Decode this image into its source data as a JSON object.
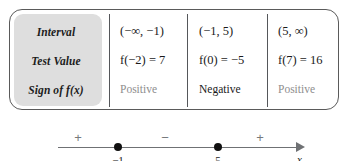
{
  "table": {
    "row_labels": [
      "Interval",
      "Test Value",
      "Sign of f(x)"
    ],
    "columns": [
      {
        "interval": "(−∞, −1)",
        "test_value": "f(−2) = 7",
        "sign": "Positive"
      },
      {
        "interval": "(−1, 5)",
        "test_value": "f(0) = −5",
        "sign": "Negative"
      },
      {
        "interval": "(5, ∞)",
        "test_value": "f(7) = 16",
        "sign": "Positive"
      }
    ],
    "label_panel_color": "#dedede",
    "border_color": "#5a5a5a",
    "muted_text_color": "#8e8e8e"
  },
  "number_line": {
    "signs": [
      "+",
      "−",
      "+"
    ],
    "tick_labels": [
      "−1",
      "5"
    ],
    "axis_label": "x",
    "axis_color": "#6f7174",
    "point_color": "#111111"
  }
}
